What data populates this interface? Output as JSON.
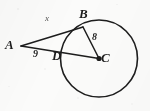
{
  "figure": {
    "kind": "circle-tangent-secant-diagram",
    "background_color": "#fbfbfa",
    "ink_color": "#1d1d1d",
    "width": 150,
    "height": 111,
    "circle": {
      "name": "circle-c",
      "center_x": 99,
      "center_y": 58.5,
      "radius": 38.5,
      "stroke_width": 1.6
    },
    "points": [
      {
        "id": "A",
        "label": "A",
        "x": 21,
        "y": 46,
        "label_x": 5,
        "label_y": 38,
        "dot": false
      },
      {
        "id": "B",
        "label": "B",
        "x": 83,
        "y": 27,
        "label_x": 79,
        "label_y": 7,
        "dot": false
      },
      {
        "id": "D",
        "label": "D",
        "x": 61.5,
        "y": 52.5,
        "label_x": 52,
        "label_y": 49,
        "dot": false
      },
      {
        "id": "C",
        "label": "C",
        "x": 99,
        "y": 58.5,
        "label_x": 101,
        "label_y": 51,
        "dot": true
      }
    ],
    "segments": [
      {
        "id": "AB",
        "name": "tangent-segment-ab",
        "x1": 21,
        "y1": 46,
        "x2": 83,
        "y2": 27
      },
      {
        "id": "BC",
        "name": "radius-segment-bc",
        "x1": 83,
        "y1": 27,
        "x2": 99,
        "y2": 58.5
      },
      {
        "id": "AC",
        "name": "secant-segment-ac",
        "x1": 21,
        "y1": 46,
        "x2": 99,
        "y2": 58.5
      }
    ],
    "measures": [
      {
        "id": "x",
        "label": "x",
        "for": "AB",
        "x": 45,
        "y": 14,
        "style": "faint"
      },
      {
        "id": "8",
        "label": "8",
        "for": "BC",
        "x": 92,
        "y": 32,
        "style": "normal"
      },
      {
        "id": "9",
        "label": "9",
        "for": "AD",
        "x": 33,
        "y": 49,
        "style": "normal"
      }
    ]
  }
}
